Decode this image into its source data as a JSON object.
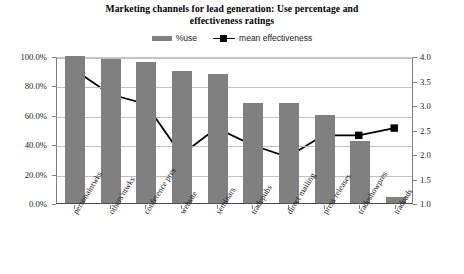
{
  "chart_data": {
    "type": "bar",
    "title": "Marketing channels for lead generation: Use percentage and effectiveness ratings",
    "title_line1": "Marketing channels for lead generation: Use percentage and",
    "title_line2": "effectiveness ratings",
    "xlabel": "",
    "ylabel": "",
    "grid": true,
    "legend_position": "top-center",
    "categories": [
      "personalntwks",
      "others'ntwks",
      "conference pres",
      "website",
      "seminars",
      "tradepubs",
      "direct mailing",
      "press releases",
      "tradeshowpres",
      "tradeads"
    ],
    "series": [
      {
        "name": "%use",
        "type": "bar",
        "axis": "left",
        "color": "#808080",
        "values": [
          100.0,
          98.0,
          96.0,
          90.0,
          88.0,
          68.0,
          68.0,
          60.0,
          42.0,
          4.0
        ]
      },
      {
        "name": "mean effectiveness",
        "type": "line",
        "axis": "right",
        "color": "#000000",
        "values": [
          3.75,
          3.25,
          3.05,
          2.0,
          2.55,
          2.2,
          1.95,
          2.4,
          2.4,
          2.55
        ]
      }
    ],
    "y_left": {
      "min": 0,
      "max": 100,
      "step": 20,
      "ticks": [
        "0.0%",
        "20.0%",
        "40.0%",
        "60.0%",
        "80.0%",
        "100.0%"
      ],
      "tick_values": [
        0,
        20,
        40,
        60,
        80,
        100
      ]
    },
    "y_right": {
      "min": 1.0,
      "max": 4.0,
      "step": 0.5,
      "ticks": [
        "1.0",
        "1.5",
        "2.0",
        "2.5",
        "3.0",
        "3.5",
        "4.0"
      ],
      "tick_values": [
        1.0,
        1.5,
        2.0,
        2.5,
        3.0,
        3.5,
        4.0
      ]
    },
    "legend": [
      {
        "label": "%use",
        "marker": "bar-swatch"
      },
      {
        "label": "mean effectiveness",
        "marker": "line-square-marker"
      }
    ]
  }
}
